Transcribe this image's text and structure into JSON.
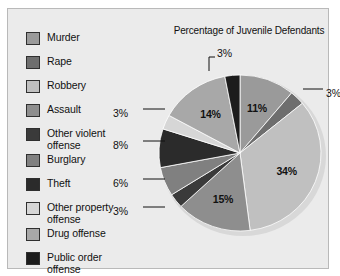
{
  "chart_data": {
    "type": "pie",
    "title": "Percentage of Juvenile Defendants",
    "categories": [
      "Murder",
      "Rape",
      "Robbery",
      "Assault",
      "Other violent offense",
      "Burglary",
      "Theft",
      "Other property offense",
      "Drug offense",
      "Public order offense"
    ],
    "values": [
      11,
      3,
      34,
      15,
      3,
      6,
      8,
      3,
      14,
      3
    ],
    "value_labels": [
      "11%",
      "3%",
      "34%",
      "15%",
      "3%",
      "6%",
      "8%",
      "3%",
      "14%",
      "3%"
    ],
    "colors": [
      "#9a9a9a",
      "#6e6e6e",
      "#c0c0c0",
      "#8e8e8e",
      "#3a3a3a",
      "#808080",
      "#2b2b2b",
      "#d6d6d6",
      "#a8a8a8",
      "#1c1c1c"
    ],
    "legend_position": "left",
    "start_angle_deg": 0,
    "direction": "clockwise",
    "labels_inside": [
      "11%",
      "34%",
      "15%",
      "14%"
    ],
    "labels_callout": [
      "3%",
      "3%",
      "3%",
      "8%",
      "6%",
      "3%"
    ],
    "xlabel": "",
    "ylabel": ""
  },
  "legend": {
    "items": [
      {
        "label": "Murder",
        "color": "#9a9a9a"
      },
      {
        "label": "Rape",
        "color": "#6e6e6e"
      },
      {
        "label": "Robbery",
        "color": "#c0c0c0"
      },
      {
        "label": "Assault",
        "color": "#8e8e8e"
      },
      {
        "label": "Other violent\noffense",
        "color": "#3a3a3a"
      },
      {
        "label": "Burglary",
        "color": "#808080"
      },
      {
        "label": "Theft",
        "color": "#2b2b2b"
      },
      {
        "label": "Other property\noffense",
        "color": "#d6d6d6"
      },
      {
        "label": "Drug offense",
        "color": "#a8a8a8"
      },
      {
        "label": "Public order\noffense",
        "color": "#1c1c1c"
      }
    ]
  },
  "callouts": {
    "top": "3%",
    "upper_right": "3%",
    "left_1": "3%",
    "left_2": "8%",
    "left_3": "6%",
    "left_4": "3%"
  },
  "inside_labels": {
    "murder": "11%",
    "robbery": "34%",
    "assault": "15%",
    "drug": "14%"
  }
}
